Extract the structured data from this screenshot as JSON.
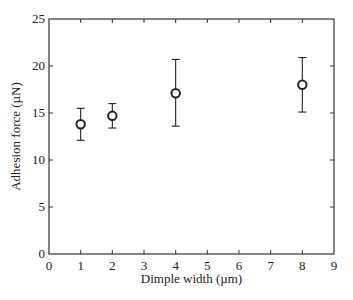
{
  "chart_data": {
    "type": "scatter",
    "title": "",
    "xlabel": "Dimple width (µm)",
    "ylabel": "Adhesion force (µN)",
    "xlim": [
      0,
      9
    ],
    "ylim": [
      0,
      25
    ],
    "xticks": [
      0,
      1,
      2,
      3,
      4,
      5,
      6,
      7,
      8,
      9
    ],
    "yticks": [
      0,
      5,
      10,
      15,
      20,
      25
    ],
    "grid": false,
    "legend": null,
    "marker": "open-circle",
    "series": [
      {
        "name": "Adhesion force",
        "x": [
          1,
          2,
          4,
          8
        ],
        "y": [
          13.8,
          14.7,
          17.1,
          18.0
        ],
        "error_low": [
          12.1,
          13.4,
          13.6,
          15.1
        ],
        "error_high": [
          15.5,
          16.0,
          20.7,
          20.9
        ]
      }
    ]
  },
  "colors": {
    "axis": "#333333",
    "marker_edge": "#222222",
    "marker_fill": "#ffffff",
    "text": "#222222"
  }
}
